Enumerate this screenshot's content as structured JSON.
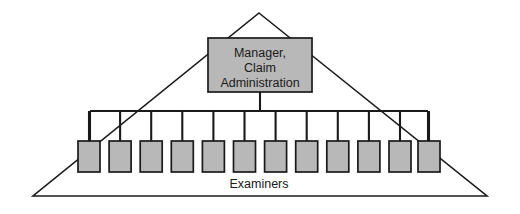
{
  "diagram": {
    "type": "organizational-chart",
    "shape": "triangle",
    "background_color": "#ffffff",
    "line_color": "#1a1a1a",
    "node_fill_color": "#b8b8b8",
    "triangle": {
      "apex": {
        "x": 259,
        "y": 13
      },
      "bottom_left": {
        "x": 33,
        "y": 196
      },
      "bottom_right": {
        "x": 487,
        "y": 196
      }
    },
    "manager": {
      "label_line_1": "Manager,",
      "label_line_2": "Claim",
      "label_line_3": "Administration",
      "box": {
        "x": 208,
        "y": 38,
        "width": 104,
        "height": 54
      }
    },
    "bus": {
      "y": 111,
      "x_start": 90,
      "x_end": 428
    },
    "examiners": {
      "group_label": "Examiners",
      "group_label_position": {
        "x": 259,
        "y": 185
      },
      "count": 12,
      "box_width": 22,
      "box_height": 31,
      "box_top": 141,
      "first_box_x": 78,
      "pitch": 31.1,
      "nodes": [
        {
          "index": 1,
          "x": 78.0
        },
        {
          "index": 2,
          "x": 109.1
        },
        {
          "index": 3,
          "x": 140.2
        },
        {
          "index": 4,
          "x": 171.3
        },
        {
          "index": 5,
          "x": 202.4
        },
        {
          "index": 6,
          "x": 233.5
        },
        {
          "index": 7,
          "x": 264.6
        },
        {
          "index": 8,
          "x": 295.7
        },
        {
          "index": 9,
          "x": 326.8
        },
        {
          "index": 10,
          "x": 357.9
        },
        {
          "index": 11,
          "x": 389.0
        },
        {
          "index": 12,
          "x": 418.0
        }
      ]
    }
  }
}
